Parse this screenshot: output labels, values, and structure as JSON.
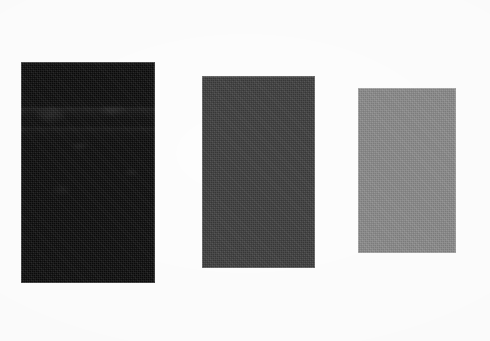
{
  "figure": {
    "background_color": "#fdfdfd",
    "width": 490,
    "height": 341,
    "medium": "scanned halftone print",
    "swatch_count": 3
  },
  "swatches": [
    {
      "label": "Swatch 1",
      "tone_name": "darkest",
      "fill_color": "#0a0a0a",
      "x": 21,
      "y": 62,
      "width": 134,
      "height": 221,
      "textured": true,
      "has_streaks": true
    },
    {
      "label": "Swatch 2",
      "tone_name": "medium dark",
      "fill_color": "#3c3c3c",
      "x": 202,
      "y": 76,
      "width": 113,
      "height": 192,
      "textured": true,
      "has_streaks": false
    },
    {
      "label": "Swatch 3",
      "tone_name": "medium gray",
      "fill_color": "#8a8a8a",
      "x": 358,
      "y": 88,
      "width": 98,
      "height": 165,
      "textured": true,
      "has_streaks": false
    }
  ],
  "chart_data": {
    "type": "bar",
    "subtitle": "",
    "xlabel": "",
    "ylabel": "",
    "categories": [
      "Swatch 1",
      "Swatch 2",
      "Swatch 3"
    ],
    "series": [
      {
        "name": "Height (px)",
        "values": [
          221,
          192,
          165
        ]
      },
      {
        "name": "Width (px)",
        "values": [
          134,
          113,
          98
        ]
      },
      {
        "name": "Gray level (0-255)",
        "values": [
          10,
          60,
          138
        ]
      }
    ],
    "colors": [
      "#0a0a0a",
      "#3c3c3c",
      "#8a8a8a"
    ],
    "grid": false,
    "legend": "none",
    "annotations": []
  }
}
